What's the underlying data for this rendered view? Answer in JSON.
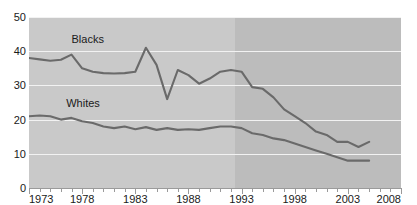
{
  "page": {
    "cutoff_text_remnant": "",
    "background_color": "#ffffff"
  },
  "axis": {
    "y_ticks": [
      "0",
      "10",
      "20",
      "30",
      "40",
      "50"
    ],
    "x_labels": [
      "1973",
      "1978",
      "1983",
      "1988",
      "1993",
      "1998",
      "2003",
      "2008"
    ]
  },
  "labels": {
    "blacks": "Blacks",
    "whites": "Whites"
  },
  "chart_data": {
    "type": "line",
    "title": "",
    "subtitle": "",
    "xlabel": "",
    "ylabel": "",
    "xlim": [
      1973,
      2008
    ],
    "ylim": [
      0,
      50
    ],
    "y_ticks": [
      0,
      10,
      20,
      30,
      40,
      50
    ],
    "x_ticks": [
      1973,
      1978,
      1983,
      1988,
      1993,
      1998,
      2003,
      2008
    ],
    "x_tick_interval_minor": 1,
    "grid": "horizontal",
    "legend": "inline-labels",
    "colors": {
      "line": "#6a6a6a",
      "band_early": "#c9c9c9",
      "band_late": "#bcbcbc",
      "gridline": "#f2f2f2",
      "axis": "#9a9a9a",
      "text": "#1a1a1a"
    },
    "shaded_regions": [
      {
        "from": 1973,
        "to": 1993,
        "color": "#c9c9c9"
      },
      {
        "from": 1993,
        "to": 2008,
        "color": "#bcbcbc"
      }
    ],
    "x": [
      1973,
      1974,
      1975,
      1976,
      1977,
      1978,
      1979,
      1980,
      1981,
      1982,
      1983,
      1984,
      1985,
      1986,
      1987,
      1988,
      1989,
      1990,
      1991,
      1992,
      1993,
      1994,
      1995,
      1996,
      1997,
      1998,
      1999,
      2000,
      2001,
      2002,
      2003,
      2004,
      2005
    ],
    "series": [
      {
        "name": "Blacks",
        "label_position": {
          "x": 1977.0,
          "y": 43.5
        },
        "values": [
          38.0,
          37.6,
          37.2,
          37.5,
          39.0,
          35.0,
          34.0,
          33.6,
          33.5,
          33.6,
          34.0,
          41.0,
          36.0,
          26.0,
          34.5,
          33.0,
          30.5,
          32.0,
          34.0,
          34.5,
          34.0,
          29.5,
          29.0,
          26.5,
          23.0,
          21.0,
          19.0,
          16.5,
          15.5,
          13.5,
          13.5,
          12.0,
          13.5
        ]
      },
      {
        "name": "Whites",
        "label_position": {
          "x": 1976.5,
          "y": 25.0
        },
        "values": [
          21.0,
          21.2,
          21.0,
          20.0,
          20.5,
          19.5,
          19.0,
          18.0,
          17.5,
          18.0,
          17.2,
          17.8,
          17.0,
          17.5,
          17.0,
          17.2,
          17.0,
          17.5,
          18.0,
          18.0,
          17.5,
          16.0,
          15.5,
          14.5,
          14.0,
          13.0,
          12.0,
          11.0,
          10.0,
          9.0,
          8.0,
          8.0,
          8.0
        ]
      }
    ]
  }
}
